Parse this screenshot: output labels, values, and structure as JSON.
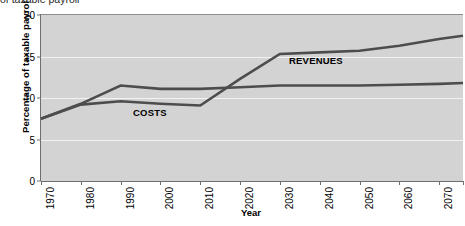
{
  "clipped_caption": "of taxable payroll",
  "chart_data": {
    "type": "line",
    "title": "",
    "xlabel": "Year",
    "ylabel": "Percentage of taxable payroll",
    "xlim": [
      1970,
      2076
    ],
    "ylim": [
      0,
      20
    ],
    "yticks": [
      0,
      5,
      10,
      15,
      20
    ],
    "xticks": [
      1970,
      1980,
      1990,
      2000,
      2010,
      2020,
      2030,
      2040,
      2050,
      2060,
      2070,
      2076
    ],
    "grid": "horizontal",
    "gridline_values": [
      5,
      10,
      15
    ],
    "legend_position": "inline-annotation",
    "series": [
      {
        "name": "COSTS",
        "color": "#4d4d4d",
        "annotation_label": "COSTS",
        "x": [
          1970,
          1980,
          1990,
          2000,
          2010,
          2020,
          2030,
          2040,
          2050,
          2060,
          2070,
          2076
        ],
        "values": [
          7.5,
          9.2,
          9.6,
          9.3,
          9.1,
          12.3,
          15.3,
          15.5,
          15.7,
          16.3,
          17.1,
          17.5
        ]
      },
      {
        "name": "REVENUES",
        "color": "#4d4d4d",
        "annotation_label": "REVENUES",
        "x": [
          1970,
          1980,
          1990,
          2000,
          2010,
          2020,
          2030,
          2040,
          2050,
          2060,
          2070,
          2076
        ],
        "values": [
          7.5,
          9.3,
          11.5,
          11.1,
          11.1,
          11.3,
          11.5,
          11.5,
          11.5,
          11.6,
          11.7,
          11.8
        ]
      }
    ]
  }
}
